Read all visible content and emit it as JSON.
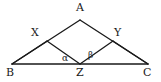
{
  "figure": {
    "type": "geometry-diagram",
    "background_color": "#ffffff",
    "stroke_color": "#1a1a1a",
    "text_color": "#1a1a1a",
    "width": 161,
    "height": 82,
    "points": {
      "A": {
        "label": "A",
        "x": 80,
        "y": 20
      },
      "B": {
        "label": "B",
        "x": 12,
        "y": 64
      },
      "C": {
        "label": "C",
        "x": 148,
        "y": 64
      },
      "X": {
        "label": "X",
        "x": 47,
        "y": 41
      },
      "Y": {
        "label": "Y",
        "x": 113,
        "y": 41
      },
      "Z": {
        "label": "Z",
        "x": 80,
        "y": 64
      }
    },
    "angles": {
      "alpha": {
        "label": "α",
        "at": "Z",
        "between": [
          "ZX",
          "ZB"
        ]
      },
      "beta": {
        "label": "β",
        "at": "Z",
        "between": [
          "ZY",
          "ZC"
        ]
      }
    },
    "segments": [
      {
        "name": "BA",
        "from": "B",
        "to": "A"
      },
      {
        "name": "AC",
        "from": "A",
        "to": "C"
      },
      {
        "name": "BC",
        "from": "B",
        "to": "C"
      },
      {
        "name": "XZ",
        "from": "X",
        "to": "Z"
      },
      {
        "name": "ZY",
        "from": "Z",
        "to": "Y"
      }
    ]
  }
}
